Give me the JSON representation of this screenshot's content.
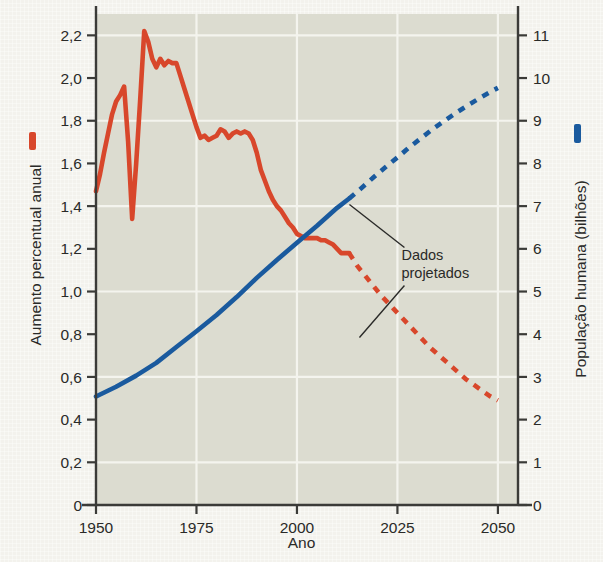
{
  "chart_data": {
    "type": "line",
    "title": "",
    "xlabel": "Ano",
    "ylabel_left": "Aumento percentual anual",
    "ylabel_right": "População humana (bilhões)",
    "xlim": [
      1950,
      2055
    ],
    "xticks": [
      1950,
      1975,
      2000,
      2025,
      2050
    ],
    "xticklabels": [
      "1950",
      "1975",
      "2000",
      "2025",
      "2050"
    ],
    "ylim_left": [
      0,
      2.3
    ],
    "yticks_left": [
      0,
      0.2,
      0.4,
      0.6,
      0.8,
      1.0,
      1.2,
      1.4,
      1.6,
      1.8,
      2.0,
      2.2
    ],
    "yticklabels_left": [
      "0",
      "0,2",
      "0,4",
      "0,6",
      "0,8",
      "1,0",
      "1,2",
      "1,4",
      "1,6",
      "1,8",
      "2,0",
      "2,2"
    ],
    "ylim_right": [
      0,
      11.5
    ],
    "yticks_right": [
      0,
      1,
      2,
      3,
      4,
      5,
      6,
      7,
      8,
      9,
      10,
      11
    ],
    "yticklabels_right": [
      "0",
      "1",
      "2",
      "3",
      "4",
      "5",
      "6",
      "7",
      "8",
      "9",
      "10",
      "11"
    ],
    "grid": true,
    "legend_position": "axis-titles",
    "series": [
      {
        "name": "Aumento percentual anual",
        "axis": "left",
        "color": "#d8472b",
        "solid_end_year": 2013,
        "x": [
          1950,
          1951,
          1952,
          1953,
          1954,
          1955,
          1956,
          1957,
          1958,
          1959,
          1960,
          1961,
          1962,
          1963,
          1964,
          1965,
          1966,
          1967,
          1968,
          1969,
          1970,
          1971,
          1972,
          1973,
          1974,
          1975,
          1976,
          1977,
          1978,
          1979,
          1980,
          1981,
          1982,
          1983,
          1984,
          1985,
          1986,
          1987,
          1988,
          1989,
          1990,
          1991,
          1992,
          1993,
          1994,
          1995,
          1996,
          1997,
          1998,
          1999,
          2000,
          2001,
          2002,
          2003,
          2004,
          2005,
          2006,
          2007,
          2008,
          2009,
          2010,
          2011,
          2012,
          2013
        ],
        "y": [
          1.47,
          1.55,
          1.65,
          1.74,
          1.83,
          1.89,
          1.92,
          1.96,
          1.7,
          1.34,
          1.6,
          1.9,
          2.22,
          2.17,
          2.09,
          2.05,
          2.09,
          2.06,
          2.08,
          2.07,
          2.07,
          2.01,
          1.95,
          1.89,
          1.83,
          1.77,
          1.72,
          1.73,
          1.71,
          1.72,
          1.73,
          1.76,
          1.75,
          1.72,
          1.74,
          1.75,
          1.74,
          1.75,
          1.74,
          1.71,
          1.65,
          1.57,
          1.52,
          1.47,
          1.43,
          1.4,
          1.38,
          1.35,
          1.32,
          1.3,
          1.27,
          1.26,
          1.25,
          1.25,
          1.25,
          1.25,
          1.24,
          1.24,
          1.23,
          1.22,
          1.2,
          1.18,
          1.18,
          1.18
        ]
      },
      {
        "name": "Aumento percentual anual (projetado)",
        "axis": "left",
        "color": "#d8472b",
        "style": "dashed",
        "x": [
          2013,
          2015,
          2018,
          2021,
          2024,
          2027,
          2030,
          2033,
          2036,
          2039,
          2042,
          2045,
          2048,
          2050
        ],
        "y": [
          1.18,
          1.12,
          1.05,
          0.98,
          0.92,
          0.86,
          0.8,
          0.74,
          0.69,
          0.64,
          0.59,
          0.55,
          0.51,
          0.49
        ]
      },
      {
        "name": "População humana (bilhões)",
        "axis": "right",
        "color": "#1a5a9e",
        "solid_end_year": 2013,
        "x": [
          1950,
          1955,
          1960,
          1965,
          1970,
          1975,
          1980,
          1985,
          1990,
          1995,
          2000,
          2005,
          2010,
          2013
        ],
        "y": [
          2.54,
          2.77,
          3.03,
          3.33,
          3.7,
          4.07,
          4.45,
          4.87,
          5.32,
          5.74,
          6.14,
          6.54,
          6.96,
          7.18
        ]
      },
      {
        "name": "População humana (projetado)",
        "axis": "right",
        "color": "#1a5a9e",
        "style": "dashed",
        "x": [
          2013,
          2016,
          2019,
          2022,
          2025,
          2028,
          2031,
          2034,
          2037,
          2040,
          2043,
          2046,
          2049,
          2050
        ],
        "y": [
          7.18,
          7.42,
          7.67,
          7.91,
          8.14,
          8.38,
          8.6,
          8.82,
          9.02,
          9.21,
          9.39,
          9.56,
          9.72,
          9.77
        ]
      }
    ],
    "annotations": [
      {
        "text_line1": "Dados",
        "text_line2": "projetados",
        "x": 2026,
        "y_left": 1.15
      }
    ]
  },
  "legend": {
    "left_marker_color": "#d8472b",
    "right_marker_color": "#1a5a9e"
  },
  "colors": {
    "red": "#d8472b",
    "blue": "#1a5a9e",
    "plot_bg": "#dcdcd0",
    "page_bg": "#f3f2ed",
    "axis": "#3b3b38",
    "gridline": "#f4f4ee",
    "text": "#2a2a28"
  }
}
